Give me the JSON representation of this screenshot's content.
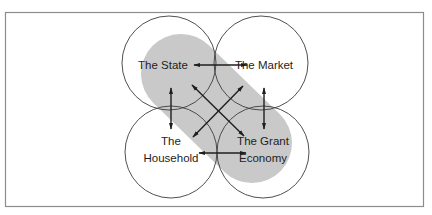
{
  "diagram": {
    "title": "",
    "colors": {
      "background": "#ffffff",
      "frame": "#8c8c8c",
      "circle_stroke": "#3c3c3c",
      "highlight": "#c9c9c9",
      "arrow": "#1e1e1e",
      "text": "#1e1e1e"
    },
    "nodes": [
      {
        "id": "state",
        "label_lines": [
          "The State"
        ]
      },
      {
        "id": "market",
        "label_lines": [
          "The Market"
        ]
      },
      {
        "id": "household",
        "label_lines": [
          "The",
          "Household"
        ]
      },
      {
        "id": "grant",
        "label_lines": [
          "The Grant",
          "Economy"
        ]
      }
    ],
    "highlight": {
      "description": "shaded band linking The State and The Grant Economy",
      "from": "state",
      "to": "grant"
    },
    "edges": [
      {
        "from": "state",
        "to": "market",
        "direction": "both"
      },
      {
        "from": "household",
        "to": "grant",
        "direction": "both"
      },
      {
        "from": "state",
        "to": "household",
        "direction": "both"
      },
      {
        "from": "market",
        "to": "grant",
        "direction": "both"
      },
      {
        "from": "state",
        "to": "grant",
        "direction": "both"
      },
      {
        "from": "market",
        "to": "household",
        "direction": "both"
      }
    ]
  }
}
